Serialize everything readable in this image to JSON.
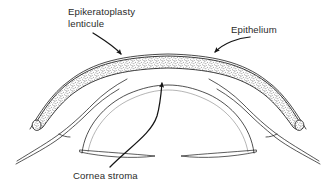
{
  "figure": {
    "type": "anatomical-line-diagram",
    "background_color": "#ffffff",
    "ink_color": "#1a1a1a",
    "text_color": "#2b2b2b",
    "stipple_color": "#3a3a3a"
  },
  "labels": {
    "lenticule": {
      "line1": "Epikeratoplasty",
      "line2": "lenticule",
      "points_to": "epikeratoplasty-lenticule-band"
    },
    "epithelium": {
      "text": "Epithelium",
      "points_to": "epithelium-layer"
    },
    "cornea_stroma": {
      "text": "Cornea stroma",
      "points_to": "cornea-stroma-dome"
    }
  },
  "structures": [
    {
      "name": "epikeratoplasty-lenticule",
      "description": "Stippled crescent band overlying the cornea, tapering to rounded tips at left and right"
    },
    {
      "name": "epithelium",
      "description": "Thin outer line covering the lenticule surface"
    },
    {
      "name": "cornea-stroma",
      "description": "Inner dome beneath the lenticule"
    },
    {
      "name": "corneal-lamella",
      "description": "Two narrow lens-shaped slivers at the base of the stroma dome"
    },
    {
      "name": "scleral-surface",
      "description": "Thin double lines extending to lower left and lower right"
    }
  ],
  "annotations": {
    "arrowhead_style": "solid-triangle",
    "leader_style": "curved-line",
    "arrow_count": 3
  }
}
